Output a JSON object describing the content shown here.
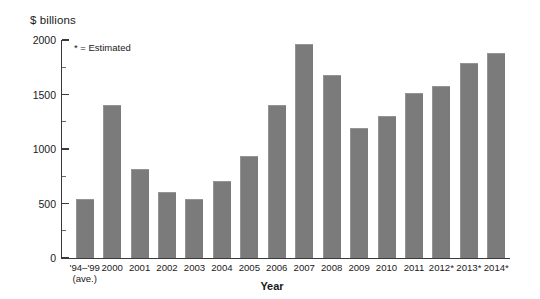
{
  "chart_data": {
    "type": "bar",
    "title": "",
    "xlabel": "Year",
    "ylabel": "$ billions",
    "ylim": [
      0,
      2000
    ],
    "ytick_values": [
      0,
      500,
      1000,
      1500,
      2000
    ],
    "ytick_labels": [
      "0",
      "500",
      "1000",
      "1500",
      "2000"
    ],
    "yminor_values": [
      250,
      750,
      1250,
      1750
    ],
    "grid": false,
    "legend": false,
    "annotation": "* = Estimated",
    "bar_color": "#7b7b7b",
    "axis_color": "#3a3a3a",
    "categories": [
      "'94–'99",
      "2000",
      "2001",
      "2002",
      "2003",
      "2004",
      "2005",
      "2006",
      "2007",
      "2008",
      "2009",
      "2010",
      "2011",
      "2012*",
      "2013*",
      "2014*"
    ],
    "category_sublabels": [
      "(ave.)",
      "",
      "",
      "",
      "",
      "",
      "",
      "",
      "",
      "",
      "",
      "",
      "",
      "",
      "",
      ""
    ],
    "values": [
      540,
      1400,
      820,
      610,
      540,
      710,
      940,
      1400,
      1965,
      1675,
      1190,
      1300,
      1510,
      1580,
      1785,
      1880
    ]
  }
}
